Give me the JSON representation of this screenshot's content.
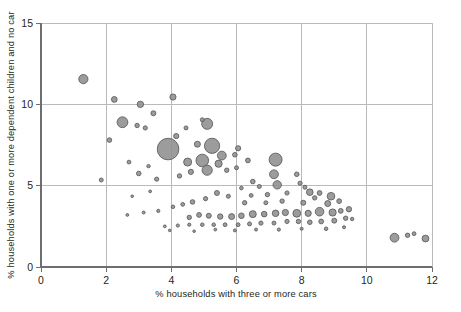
{
  "chart_data": {
    "type": "scatter",
    "title": "",
    "subtitle": "",
    "xlabel": "% households with three or more cars",
    "ylabel": "% households with one or more dependent children and no car",
    "xlim": [
      0,
      12
    ],
    "ylim": [
      0,
      15
    ],
    "xticks": [
      0,
      2,
      4,
      6,
      8,
      10,
      12
    ],
    "yticks": [
      0,
      5,
      10,
      15
    ],
    "xticklabels": [
      "0",
      "2",
      "4",
      "6",
      "8",
      "10",
      "12"
    ],
    "yticklabels": [
      "0",
      "5",
      "10",
      "15"
    ],
    "grid": true,
    "legend": false,
    "marker": "circle",
    "marker_fill": "#8e8e90",
    "marker_stroke": "#58585a",
    "size_encoding": "bubble area (population weight)",
    "points": [
      {
        "x": 1.3,
        "y": 11.55,
        "r": 4.6
      },
      {
        "x": 2.25,
        "y": 10.3,
        "r": 2.9
      },
      {
        "x": 3.05,
        "y": 10.0,
        "r": 3.2
      },
      {
        "x": 4.05,
        "y": 10.45,
        "r": 3.1
      },
      {
        "x": 3.45,
        "y": 9.45,
        "r": 2.5
      },
      {
        "x": 2.5,
        "y": 8.9,
        "r": 5.4
      },
      {
        "x": 2.95,
        "y": 8.7,
        "r": 2.2
      },
      {
        "x": 3.2,
        "y": 8.55,
        "r": 2.1
      },
      {
        "x": 5.1,
        "y": 8.8,
        "r": 5.5
      },
      {
        "x": 2.1,
        "y": 7.8,
        "r": 2.3
      },
      {
        "x": 4.15,
        "y": 8.05,
        "r": 2.6
      },
      {
        "x": 4.8,
        "y": 7.55,
        "r": 3.0
      },
      {
        "x": 3.9,
        "y": 7.25,
        "r": 10.8
      },
      {
        "x": 5.25,
        "y": 7.45,
        "r": 7.6
      },
      {
        "x": 6.05,
        "y": 7.3,
        "r": 2.6
      },
      {
        "x": 5.55,
        "y": 6.85,
        "r": 4.4
      },
      {
        "x": 5.95,
        "y": 6.9,
        "r": 2.3
      },
      {
        "x": 4.95,
        "y": 6.55,
        "r": 6.3
      },
      {
        "x": 4.5,
        "y": 6.45,
        "r": 4.0
      },
      {
        "x": 5.45,
        "y": 6.35,
        "r": 3.6
      },
      {
        "x": 6.35,
        "y": 6.55,
        "r": 2.4
      },
      {
        "x": 5.1,
        "y": 5.95,
        "r": 5.1
      },
      {
        "x": 4.6,
        "y": 5.85,
        "r": 2.6
      },
      {
        "x": 5.7,
        "y": 5.95,
        "r": 2.2
      },
      {
        "x": 6.0,
        "y": 6.1,
        "r": 2.0
      },
      {
        "x": 4.25,
        "y": 5.6,
        "r": 2.2
      },
      {
        "x": 3.0,
        "y": 5.75,
        "r": 2.3
      },
      {
        "x": 3.55,
        "y": 5.4,
        "r": 2.1
      },
      {
        "x": 1.85,
        "y": 5.35,
        "r": 2.0
      },
      {
        "x": 7.2,
        "y": 6.6,
        "r": 6.5
      },
      {
        "x": 7.15,
        "y": 5.7,
        "r": 4.4
      },
      {
        "x": 7.25,
        "y": 5.05,
        "r": 4.2
      },
      {
        "x": 7.85,
        "y": 5.7,
        "r": 2.3
      },
      {
        "x": 7.95,
        "y": 5.15,
        "r": 2.1
      },
      {
        "x": 8.1,
        "y": 4.9,
        "r": 2.0
      },
      {
        "x": 6.5,
        "y": 5.25,
        "r": 2.3
      },
      {
        "x": 6.7,
        "y": 4.95,
        "r": 2.0
      },
      {
        "x": 8.25,
        "y": 4.6,
        "r": 3.3
      },
      {
        "x": 8.55,
        "y": 4.55,
        "r": 2.4
      },
      {
        "x": 8.4,
        "y": 4.25,
        "r": 2.2
      },
      {
        "x": 7.55,
        "y": 4.55,
        "r": 2.1
      },
      {
        "x": 6.95,
        "y": 4.45,
        "r": 2.2
      },
      {
        "x": 6.45,
        "y": 4.4,
        "r": 1.9
      },
      {
        "x": 8.9,
        "y": 4.35,
        "r": 3.8
      },
      {
        "x": 9.15,
        "y": 4.05,
        "r": 2.4
      },
      {
        "x": 8.8,
        "y": 3.9,
        "r": 3.0
      },
      {
        "x": 8.05,
        "y": 3.95,
        "r": 2.5
      },
      {
        "x": 7.4,
        "y": 4.05,
        "r": 2.2
      },
      {
        "x": 6.9,
        "y": 3.95,
        "r": 2.0
      },
      {
        "x": 6.25,
        "y": 3.95,
        "r": 2.2
      },
      {
        "x": 5.75,
        "y": 4.35,
        "r": 2.0
      },
      {
        "x": 5.4,
        "y": 4.55,
        "r": 2.5
      },
      {
        "x": 5.05,
        "y": 4.2,
        "r": 2.1
      },
      {
        "x": 4.65,
        "y": 4.0,
        "r": 2.3
      },
      {
        "x": 4.35,
        "y": 3.85,
        "r": 1.9
      },
      {
        "x": 4.05,
        "y": 3.7,
        "r": 1.8
      },
      {
        "x": 3.6,
        "y": 3.45,
        "r": 1.6
      },
      {
        "x": 3.15,
        "y": 3.35,
        "r": 1.5
      },
      {
        "x": 2.65,
        "y": 3.2,
        "r": 1.4
      },
      {
        "x": 9.45,
        "y": 3.55,
        "r": 2.7
      },
      {
        "x": 9.2,
        "y": 3.45,
        "r": 2.4
      },
      {
        "x": 8.95,
        "y": 3.35,
        "r": 3.6
      },
      {
        "x": 8.55,
        "y": 3.4,
        "r": 4.3
      },
      {
        "x": 8.2,
        "y": 3.3,
        "r": 3.1
      },
      {
        "x": 7.85,
        "y": 3.3,
        "r": 3.9
      },
      {
        "x": 7.5,
        "y": 3.35,
        "r": 3.1
      },
      {
        "x": 7.2,
        "y": 3.3,
        "r": 3.3
      },
      {
        "x": 6.85,
        "y": 3.25,
        "r": 2.8
      },
      {
        "x": 6.5,
        "y": 3.25,
        "r": 3.5
      },
      {
        "x": 6.15,
        "y": 3.15,
        "r": 2.8
      },
      {
        "x": 5.85,
        "y": 3.1,
        "r": 3.0
      },
      {
        "x": 5.5,
        "y": 3.1,
        "r": 2.7
      },
      {
        "x": 5.15,
        "y": 3.15,
        "r": 2.5
      },
      {
        "x": 4.85,
        "y": 3.2,
        "r": 2.4
      },
      {
        "x": 4.55,
        "y": 3.05,
        "r": 2.2
      },
      {
        "x": 9.35,
        "y": 3.0,
        "r": 2.2
      },
      {
        "x": 9.0,
        "y": 2.85,
        "r": 2.5
      },
      {
        "x": 8.6,
        "y": 2.8,
        "r": 2.4
      },
      {
        "x": 8.25,
        "y": 2.75,
        "r": 2.3
      },
      {
        "x": 7.9,
        "y": 2.8,
        "r": 2.2
      },
      {
        "x": 7.55,
        "y": 2.8,
        "r": 2.1
      },
      {
        "x": 7.15,
        "y": 2.7,
        "r": 2.0
      },
      {
        "x": 6.75,
        "y": 2.7,
        "r": 2.1
      },
      {
        "x": 6.4,
        "y": 2.65,
        "r": 2.0
      },
      {
        "x": 6.05,
        "y": 2.6,
        "r": 1.9
      },
      {
        "x": 5.65,
        "y": 2.6,
        "r": 1.9
      },
      {
        "x": 5.3,
        "y": 2.6,
        "r": 1.8
      },
      {
        "x": 4.95,
        "y": 2.6,
        "r": 1.8
      },
      {
        "x": 4.55,
        "y": 2.6,
        "r": 1.6
      },
      {
        "x": 4.2,
        "y": 2.55,
        "r": 1.6
      },
      {
        "x": 3.8,
        "y": 2.5,
        "r": 1.4
      },
      {
        "x": 9.3,
        "y": 2.45,
        "r": 1.5
      },
      {
        "x": 8.75,
        "y": 2.35,
        "r": 1.8
      },
      {
        "x": 8.0,
        "y": 2.35,
        "r": 1.5
      },
      {
        "x": 7.3,
        "y": 2.3,
        "r": 1.6
      },
      {
        "x": 6.6,
        "y": 2.3,
        "r": 1.5
      },
      {
        "x": 5.95,
        "y": 2.25,
        "r": 1.5
      },
      {
        "x": 5.35,
        "y": 2.3,
        "r": 1.4
      },
      {
        "x": 4.7,
        "y": 2.2,
        "r": 1.3
      },
      {
        "x": 3.95,
        "y": 2.25,
        "r": 1.3
      },
      {
        "x": 10.85,
        "y": 1.8,
        "r": 4.4
      },
      {
        "x": 11.25,
        "y": 1.95,
        "r": 2.2
      },
      {
        "x": 11.45,
        "y": 2.05,
        "r": 1.9
      },
      {
        "x": 11.8,
        "y": 1.75,
        "r": 3.4
      },
      {
        "x": 3.35,
        "y": 4.65,
        "r": 1.4
      },
      {
        "x": 2.8,
        "y": 4.35,
        "r": 1.3
      },
      {
        "x": 4.95,
        "y": 9.05,
        "r": 2.0
      },
      {
        "x": 4.45,
        "y": 8.55,
        "r": 2.0
      },
      {
        "x": 2.7,
        "y": 6.45,
        "r": 1.9
      },
      {
        "x": 3.3,
        "y": 6.2,
        "r": 1.7
      },
      {
        "x": 6.15,
        "y": 4.85,
        "r": 1.8
      },
      {
        "x": 9.55,
        "y": 2.95,
        "r": 1.7
      }
    ]
  },
  "axes": {
    "x_title": "% households with three or more cars",
    "y_title": "% households with one or more dependent children and no car"
  }
}
